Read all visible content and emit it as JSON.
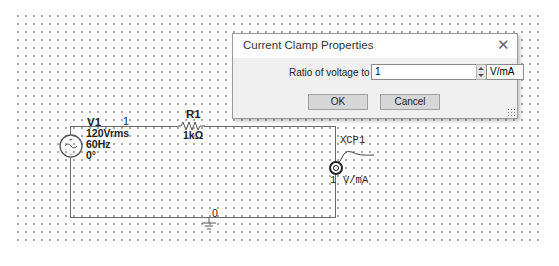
{
  "schematic": {
    "source": {
      "ref": "V1",
      "voltage": "120Vrms",
      "frequency": "60Hz",
      "phase": "0°"
    },
    "node_top": "1",
    "node_ground": "0",
    "resistor": {
      "ref": "R1",
      "value": "1kΩ"
    },
    "clamp": {
      "ref": "XCP1",
      "ratio_value": "1",
      "ratio_unit": "V/mA"
    }
  },
  "dialog": {
    "title": "Current Clamp Properties",
    "close_glyph": "✕",
    "ratio_label": "Ratio of voltage to current:",
    "ratio_value": "1",
    "unit_value": "V/mA",
    "ok_label": "OK",
    "cancel_label": "Cancel"
  }
}
